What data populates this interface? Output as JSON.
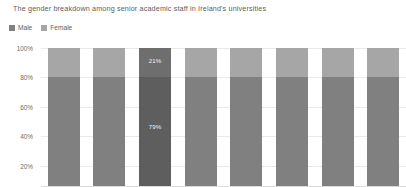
{
  "title": "The gender breakdown among senior academic staff in Ireland's universities",
  "legend": {
    "items": [
      {
        "label": "Male",
        "color": "#808080"
      },
      {
        "label": "Female",
        "color": "#a6a6a6"
      }
    ]
  },
  "axis": {
    "y_ticks": [
      "100%",
      "80%",
      "60%",
      "40%",
      "20%"
    ]
  },
  "colors": {
    "male": "#808080",
    "female": "#a6a6a6",
    "male_highlight": "#5e5e5e",
    "female_highlight": "#6e6e6e",
    "gridline": "#e9e9e9",
    "text": "#5e5e5e",
    "label_text": "#efefef",
    "background": "#ffffff"
  },
  "chart_data": {
    "type": "bar",
    "stacked": true,
    "normalized_percent": true,
    "title": "The gender breakdown among senior academic staff in Ireland's universities",
    "xlabel": "",
    "ylabel": "",
    "ylim": [
      0,
      100
    ],
    "y_ticks": [
      100,
      80,
      60,
      40,
      20
    ],
    "grid": true,
    "legend_position": "top-left",
    "categories": [
      "1",
      "2",
      "3",
      "4",
      "5",
      "6",
      "7",
      "8"
    ],
    "series": [
      {
        "name": "Female",
        "values": [
          21,
          21,
          21,
          21,
          21,
          21,
          21,
          21
        ]
      },
      {
        "name": "Male",
        "values": [
          79,
          79,
          79,
          79,
          79,
          79,
          79,
          79
        ]
      }
    ],
    "highlighted_index": 2,
    "data_labels": [
      {
        "bar_index": 2,
        "series": "Female",
        "text": "21%"
      },
      {
        "bar_index": 2,
        "series": "Male",
        "text": "79%"
      }
    ]
  },
  "bars": [
    {
      "female": 21,
      "male": 79,
      "highlight": false,
      "female_label": "",
      "male_label": ""
    },
    {
      "female": 21,
      "male": 79,
      "highlight": false,
      "female_label": "",
      "male_label": ""
    },
    {
      "female": 21,
      "male": 79,
      "highlight": true,
      "female_label": "21%",
      "male_label": "79%"
    },
    {
      "female": 21,
      "male": 79,
      "highlight": false,
      "female_label": "",
      "male_label": ""
    },
    {
      "female": 21,
      "male": 79,
      "highlight": false,
      "female_label": "",
      "male_label": ""
    },
    {
      "female": 21,
      "male": 79,
      "highlight": false,
      "female_label": "",
      "male_label": ""
    },
    {
      "female": 21,
      "male": 79,
      "highlight": false,
      "female_label": "",
      "male_label": ""
    },
    {
      "female": 21,
      "male": 79,
      "highlight": false,
      "female_label": "",
      "male_label": ""
    }
  ]
}
